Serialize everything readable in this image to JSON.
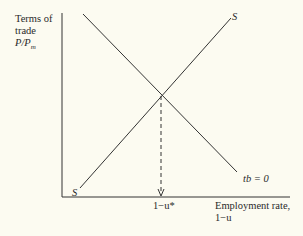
{
  "diagram": {
    "y_axis_label": {
      "line1": "Terms of",
      "line2": "trade",
      "line3": "P/P",
      "line3_sub": "m"
    },
    "x_axis_label": {
      "line1": "Employment rate,",
      "line2": "1−u"
    },
    "curve_S": {
      "label_top": "S",
      "label_bottom": "S"
    },
    "curve_tb": {
      "label": "tb = 0"
    },
    "equilibrium_tick": "1−u*"
  },
  "colors": {
    "background": "#fcfbf1",
    "ink": "#2a2a2a"
  }
}
